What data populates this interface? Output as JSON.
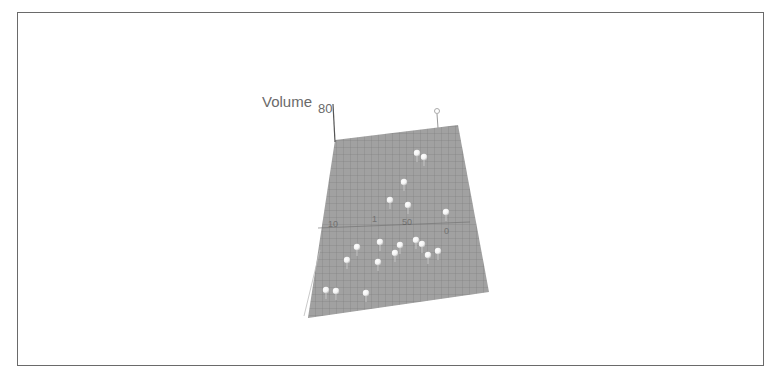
{
  "figure": {
    "frame_color": "#6a6a6a",
    "background": "#ffffff"
  },
  "chart_data": {
    "type": "scatter",
    "subtype": "3d-scatter-with-surface",
    "title": "",
    "axes": {
      "z": {
        "label": "Volume",
        "ticks": [
          "80"
        ]
      },
      "x": {
        "label": "",
        "ticks": [
          "10",
          "0"
        ]
      },
      "y": {
        "label": "",
        "ticks": [
          "1",
          "50"
        ]
      }
    },
    "surface": {
      "color": "#9a9a9a",
      "grid": true,
      "grid_color": "#7d7d7d"
    },
    "marker_color": "#ffffff",
    "points": [
      {
        "x": 417,
        "y": 153
      },
      {
        "x": 424,
        "y": 157
      },
      {
        "x": 404,
        "y": 182
      },
      {
        "x": 390,
        "y": 200
      },
      {
        "x": 408,
        "y": 205
      },
      {
        "x": 446,
        "y": 212
      },
      {
        "x": 357,
        "y": 247
      },
      {
        "x": 380,
        "y": 242
      },
      {
        "x": 400,
        "y": 245
      },
      {
        "x": 395,
        "y": 253
      },
      {
        "x": 416,
        "y": 240
      },
      {
        "x": 422,
        "y": 244
      },
      {
        "x": 438,
        "y": 251
      },
      {
        "x": 428,
        "y": 255
      },
      {
        "x": 347,
        "y": 260
      },
      {
        "x": 378,
        "y": 262
      },
      {
        "x": 326,
        "y": 290
      },
      {
        "x": 336,
        "y": 291
      },
      {
        "x": 366,
        "y": 293
      }
    ],
    "legend": null,
    "grid": true
  }
}
